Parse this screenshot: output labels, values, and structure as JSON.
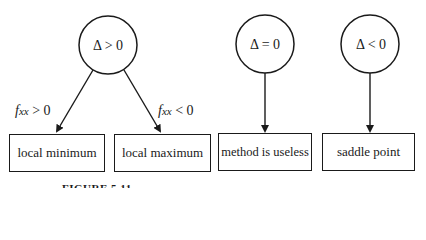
{
  "diagram": {
    "type": "decision-tree",
    "decision_nodes": [
      {
        "id": "delta-positive",
        "label": "Δ > 0"
      },
      {
        "id": "delta-zero",
        "label": "Δ = 0"
      },
      {
        "id": "delta-negative",
        "label": "Δ < 0"
      }
    ],
    "edge_labels": {
      "fxx_positive": {
        "f": "f",
        "sub": "xx",
        "rel": " > 0"
      },
      "fxx_negative": {
        "f": "f",
        "sub": "xx",
        "rel": " < 0"
      }
    },
    "outcomes": [
      {
        "id": "local-minimum",
        "label": "local minimum"
      },
      {
        "id": "local-maximum",
        "label": "local maximum"
      },
      {
        "id": "method-useless",
        "label": "method is useless"
      },
      {
        "id": "saddle-point",
        "label": "saddle point"
      }
    ],
    "edges": [
      {
        "from": "delta-positive",
        "to": "local-minimum",
        "label": "fxx > 0"
      },
      {
        "from": "delta-positive",
        "to": "local-maximum",
        "label": "fxx < 0"
      },
      {
        "from": "delta-zero",
        "to": "method-useless"
      },
      {
        "from": "delta-negative",
        "to": "saddle-point"
      }
    ],
    "caption": "FIGURE 5.11"
  }
}
